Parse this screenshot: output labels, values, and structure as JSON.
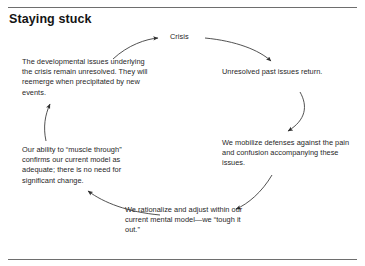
{
  "figure": {
    "title": "Staying stuck",
    "type": "cycle-diagram",
    "direction": "clockwise",
    "rules": {
      "top": true,
      "bottom": true
    },
    "nodes": [
      {
        "id": "crisis",
        "label": "Crisis",
        "position": "top-center"
      },
      {
        "id": "unresolved",
        "label": "Unresolved past issues return.",
        "position": "right-upper"
      },
      {
        "id": "mobilize",
        "label": "We mobilize defenses against the pain and confusion accompanying these issues.",
        "position": "right-lower"
      },
      {
        "id": "rationalize",
        "label": "We rationalize and adjust within our current mental model—we “tough it out.”",
        "position": "bottom-center"
      },
      {
        "id": "ability",
        "label": "Our ability to “muscle through” confirms our current model as adequate; there is no need for significant change.",
        "position": "left-lower"
      },
      {
        "id": "developmental",
        "label": "The developmental issues underlying the crisis remain unresolved. They will reemerge when precipitated by new events.",
        "position": "left-upper"
      }
    ],
    "arrows": [
      {
        "id": "crisis-to-unresolved",
        "from": "crisis",
        "to": "unresolved"
      },
      {
        "id": "unresolved-to-mobilize",
        "from": "unresolved",
        "to": "mobilize"
      },
      {
        "id": "mobilize-to-rationalize",
        "from": "mobilize",
        "to": "rationalize"
      },
      {
        "id": "rationalize-to-ability",
        "from": "rationalize",
        "to": "ability"
      },
      {
        "id": "ability-to-developmental",
        "from": "ability",
        "to": "developmental"
      },
      {
        "id": "developmental-to-crisis",
        "from": "developmental",
        "to": "crisis"
      }
    ],
    "colors": {
      "text": "#1f1f1f",
      "title": "#141414",
      "rule": "#6e6e6e",
      "arrow": "#333333",
      "background": "#ffffff"
    }
  }
}
